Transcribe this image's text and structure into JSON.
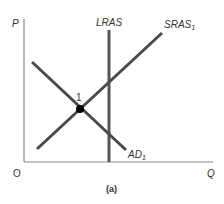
{
  "diagram": {
    "type": "AD-AS model",
    "caption": "(a)",
    "axes": {
      "y_label": "P",
      "x_label": "Q",
      "origin_label": "O"
    },
    "curves": {
      "lras": {
        "label": "LRAS",
        "sub": ""
      },
      "sras": {
        "label": "SRAS",
        "sub": "1"
      },
      "ad": {
        "label": "AD",
        "sub": "1"
      }
    },
    "points": [
      {
        "label": "1",
        "description": "equilibrium of AD1, SRAS1"
      }
    ],
    "colors": {
      "curve": "#4a4a4a",
      "axis": "#888888",
      "point": "#000000"
    }
  }
}
